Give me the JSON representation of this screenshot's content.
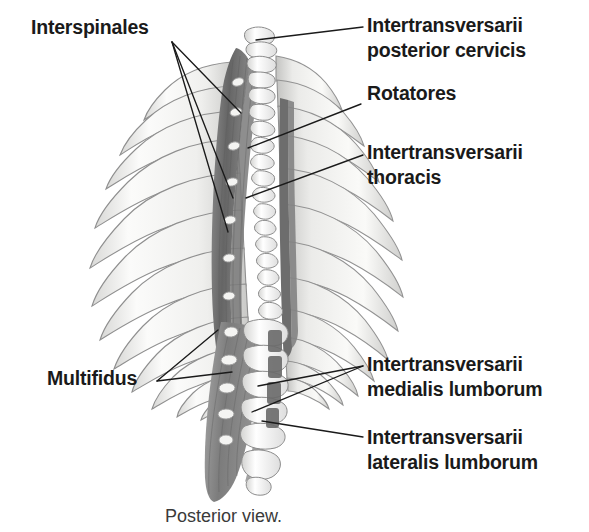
{
  "figure": {
    "caption": "Posterior view.",
    "background_color": "#ffffff",
    "text_color": "#1a1a1a",
    "caption_color": "#3a3a3a",
    "leader_line_color": "#1a1a1a",
    "muscle_dark_color": "#6e6e6e",
    "muscle_mid_color": "#8f8f8f",
    "bone_light_color": "#f2f2f0",
    "bone_outline_color": "#8a8a8a"
  },
  "labels": [
    {
      "id": "interspinales",
      "text": "Interspinales",
      "side": "left",
      "x": 31,
      "y": 15,
      "leaders": [
        {
          "from_x": 172,
          "from_y": 42,
          "to_x": 241,
          "to_y": 113
        },
        {
          "from_x": 172,
          "from_y": 42,
          "to_x": 233,
          "to_y": 198
        },
        {
          "from_x": 172,
          "from_y": 42,
          "to_x": 228,
          "to_y": 232
        }
      ]
    },
    {
      "id": "intertransversarii-posterior-cervicis",
      "text": "Intertransversarii\nposterior cervicis",
      "side": "right",
      "x": 367,
      "y": 13,
      "leaders": [
        {
          "from_x": 363,
          "from_y": 27,
          "to_x": 256,
          "to_y": 40
        }
      ]
    },
    {
      "id": "rotatores",
      "text": "Rotatores",
      "side": "right",
      "x": 367,
      "y": 81,
      "leaders": [
        {
          "from_x": 361,
          "from_y": 104,
          "to_x": 248,
          "to_y": 148
        }
      ]
    },
    {
      "id": "intertransversarii-thoracis",
      "text": "Intertransversarii\nthoracis",
      "side": "right",
      "x": 367,
      "y": 140,
      "leaders": [
        {
          "from_x": 363,
          "from_y": 155,
          "to_x": 246,
          "to_y": 198
        }
      ]
    },
    {
      "id": "multifidus",
      "text": "Multifidus",
      "side": "left",
      "x": 47,
      "y": 366,
      "leaders": [
        {
          "from_x": 157,
          "from_y": 381,
          "to_x": 218,
          "to_y": 330
        },
        {
          "from_x": 157,
          "from_y": 381,
          "to_x": 232,
          "to_y": 372
        }
      ]
    },
    {
      "id": "intertransversarii-medialis-lumborum",
      "text": "Intertransversarii\nmedialis lumborum",
      "side": "right",
      "x": 367,
      "y": 352,
      "leaders": [
        {
          "from_x": 363,
          "from_y": 366,
          "to_x": 258,
          "to_y": 386
        },
        {
          "from_x": 363,
          "from_y": 366,
          "to_x": 252,
          "to_y": 412
        }
      ]
    },
    {
      "id": "intertransversarii-lateralis-lumborum",
      "text": "Intertransversarii\nlateralis lumborum",
      "side": "right",
      "x": 367,
      "y": 425,
      "leaders": [
        {
          "from_x": 363,
          "from_y": 437,
          "to_x": 262,
          "to_y": 421
        }
      ]
    }
  ],
  "caption": {
    "text": "Posterior view.",
    "x": 165,
    "y": 506
  },
  "anatomy": {
    "view": "posterior",
    "structures": [
      "thoracic rib cage",
      "thoracic vertebrae",
      "lumbar vertebrae",
      "sacrum",
      "multifidus muscle",
      "rotatores muscle",
      "interspinales muscle",
      "intertransversarii muscles"
    ],
    "rib_pairs_visible": 12
  }
}
